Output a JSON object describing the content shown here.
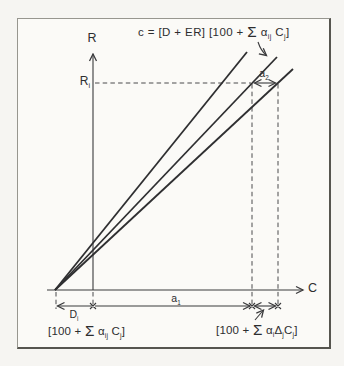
{
  "figure": {
    "equation": "c = [D + ER] [100 + Σ α_{ij} C_{j}]",
    "y_axis_label": "R",
    "x_axis_label": "C",
    "y_tick_label": "R_{i}",
    "segment_labels": {
      "a1": "a_{1}",
      "a2": "a_{2}",
      "di": "D_{i}"
    },
    "bottom_left_formula": "[100 + Σ α_{ij} C_{j}]",
    "bottom_right_formula": "[100 + Σ α_{i}Δ_{j}C_{j}]",
    "lines": [
      "steep-calibration-line",
      "middle-calibration-line",
      "flat-calibration-line"
    ],
    "colors": {
      "ink": "#3a3a3c",
      "calibration_line": "#2f2f31",
      "dash": "#4a4a4c",
      "paper": "#f6f5f2",
      "panel_bg": "#fbfaf7",
      "border": "#97968f"
    }
  }
}
